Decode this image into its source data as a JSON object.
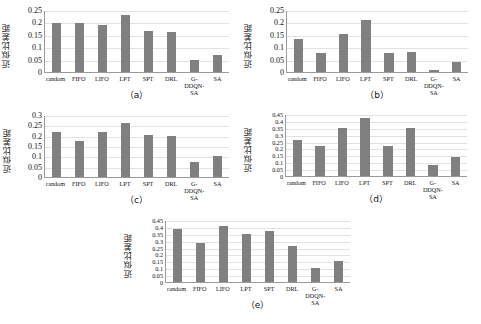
{
  "figure": {
    "ylabel": "近似比差距",
    "bar_color": "#808080",
    "grid_color": "#e2e2e2",
    "axis_color": "#9a9a9a",
    "categories": [
      "random",
      "FIFO",
      "LIFO",
      "LPT",
      "SPT",
      "DRL",
      "G-DDQN-\nSA",
      "SA"
    ]
  },
  "chart_data": [
    {
      "type": "bar",
      "panel": "(a)",
      "caption": "（a）",
      "title": "",
      "xlabel": "",
      "ylabel": "近似比差距",
      "categories": [
        "random",
        "FIFO",
        "LIFO",
        "LPT",
        "SPT",
        "DRL",
        "G-DDQN-SA",
        "SA"
      ],
      "values": [
        0.197,
        0.197,
        0.19,
        0.23,
        0.167,
        0.16,
        0.05,
        0.07
      ],
      "yticks": [
        0,
        0.05,
        0.1,
        0.15,
        0.2,
        0.25
      ],
      "yticklabels": [
        "0",
        "0.05",
        "0.1",
        "0.15",
        "0.2",
        "0.25"
      ],
      "ylim": [
        0,
        0.25
      ],
      "grid": true,
      "legend": null
    },
    {
      "type": "bar",
      "panel": "(b)",
      "caption": "（b）",
      "title": "",
      "xlabel": "",
      "ylabel": "近似比差距",
      "categories": [
        "random",
        "FIFO",
        "LIFO",
        "LPT",
        "SPT",
        "DRL",
        "G-DDQN-SA",
        "SA"
      ],
      "values": [
        0.135,
        0.077,
        0.152,
        0.21,
        0.077,
        0.082,
        0.008,
        0.04
      ],
      "yticks": [
        0,
        0.05,
        0.1,
        0.15,
        0.2,
        0.25
      ],
      "yticklabels": [
        "0",
        "0.05",
        "0.1",
        "0.15",
        "0.2",
        "0.25"
      ],
      "ylim": [
        0,
        0.25
      ],
      "grid": true,
      "legend": null
    },
    {
      "type": "bar",
      "panel": "(c)",
      "caption": "（c）",
      "title": "",
      "xlabel": "",
      "ylabel": "近似比差距",
      "categories": [
        "random",
        "FIFO",
        "LIFO",
        "LPT",
        "SPT",
        "DRL",
        "G-DDQN-SA",
        "SA"
      ],
      "values": [
        0.22,
        0.175,
        0.22,
        0.26,
        0.205,
        0.2,
        0.072,
        0.1
      ],
      "yticks": [
        0,
        0.05,
        0.1,
        0.15,
        0.2,
        0.25,
        0.3
      ],
      "yticklabels": [
        "0",
        "0.05",
        "0.1",
        "0.15",
        "0.2",
        "0.25",
        "0.3"
      ],
      "ylim": [
        0,
        0.3
      ],
      "grid": true,
      "legend": null
    },
    {
      "type": "bar",
      "panel": "(d)",
      "caption": "（d）",
      "title": "",
      "xlabel": "",
      "ylabel": "近似比差距",
      "categories": [
        "random",
        "FIFO",
        "LIFO",
        "LPT",
        "SPT",
        "DRL",
        "G-DDQN-SA",
        "SA"
      ],
      "values": [
        0.26,
        0.215,
        0.345,
        0.42,
        0.22,
        0.35,
        0.08,
        0.14
      ],
      "yticks": [
        0,
        0.05,
        0.1,
        0.15,
        0.2,
        0.25,
        0.3,
        0.35,
        0.4,
        0.45
      ],
      "yticklabels": [
        "0",
        "0.05",
        "0.1",
        "0.15",
        "0.2",
        "0.25",
        "0.3",
        "0.35",
        "0.4",
        "0.45"
      ],
      "ylim": [
        0,
        0.45
      ],
      "grid": true,
      "legend": null
    },
    {
      "type": "bar",
      "panel": "(e)",
      "caption": "（e）",
      "title": "",
      "xlabel": "",
      "ylabel": "近似比差距",
      "categories": [
        "random",
        "FIFO",
        "LIFO",
        "LPT",
        "SPT",
        "DRL",
        "G-DDQN-SA",
        "SA"
      ],
      "values": [
        0.385,
        0.285,
        0.405,
        0.35,
        0.37,
        0.26,
        0.1,
        0.155
      ],
      "yticks": [
        0,
        0.05,
        0.1,
        0.15,
        0.2,
        0.25,
        0.3,
        0.35,
        0.4,
        0.45
      ],
      "yticklabels": [
        "0",
        "0.05",
        "0.1",
        "0.15",
        "0.2",
        "0.25",
        "0.3",
        "0.35",
        "0.4",
        "0.45"
      ],
      "ylim": [
        0,
        0.45
      ],
      "grid": true,
      "legend": null
    }
  ]
}
